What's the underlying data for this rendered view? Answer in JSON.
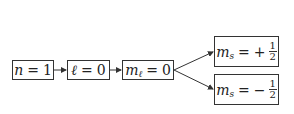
{
  "diagram": {
    "type": "flow",
    "nodes": [
      {
        "id": "n",
        "var": "n",
        "sub": "",
        "op": "=",
        "sign": "",
        "value": "1"
      },
      {
        "id": "l",
        "var": "ℓ",
        "sub": "",
        "op": "=",
        "sign": "",
        "value": "0"
      },
      {
        "id": "ml",
        "var": "m",
        "sub": "ℓ",
        "op": "=",
        "sign": "",
        "value": "0"
      },
      {
        "id": "ms_up",
        "var": "m",
        "sub": "s",
        "op": "=",
        "sign": "+",
        "num": "1",
        "den": "2"
      },
      {
        "id": "ms_down",
        "var": "m",
        "sub": "s",
        "op": "=",
        "sign": "−",
        "num": "1",
        "den": "2"
      }
    ],
    "edges": [
      {
        "from": "n",
        "to": "l"
      },
      {
        "from": "l",
        "to": "ml"
      },
      {
        "from": "ml",
        "to": "ms_up"
      },
      {
        "from": "ml",
        "to": "ms_down"
      }
    ],
    "colors": {
      "stroke": "#333333",
      "background": "#ffffff"
    }
  }
}
